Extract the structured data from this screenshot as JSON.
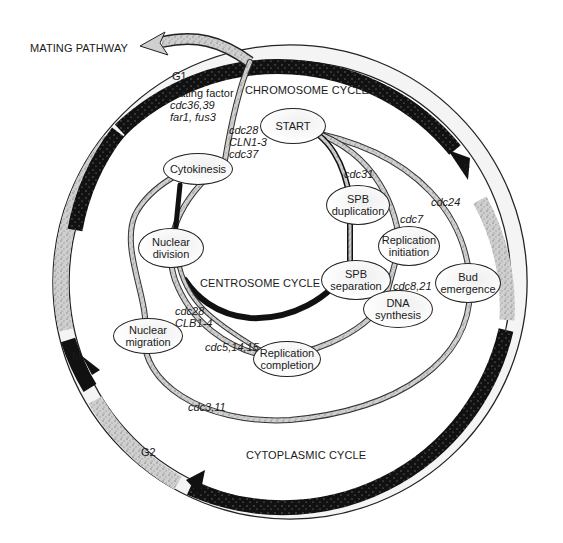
{
  "diagram": {
    "title_labels": {
      "mating_pathway": "MATING PATHWAY",
      "chromosome_cycle": "CHROMOSOME CYCLE",
      "centrosome_cycle": "CENTROSOME CYCLE",
      "cytoplasmic_cycle": "CYTOPLASMIC CYCLE"
    },
    "phases": {
      "g1": "G1",
      "s": "S",
      "g2": "G2",
      "m": "M"
    },
    "mating_block": {
      "line1": "mating  factor",
      "line2": "cdc36,39",
      "line3": "far1, fus3"
    },
    "start_genes": {
      "line1": "cdc28",
      "line2": "CLN1-3",
      "line3": "cdc37"
    },
    "nodes": {
      "start": [
        "START"
      ],
      "cytokinesis": [
        "Cytokinesis"
      ],
      "spb_duplication": [
        "SPB",
        "duplication"
      ],
      "replication_initiation": [
        "Replication",
        "initiation"
      ],
      "nuclear_division": [
        "Nuclear",
        "division"
      ],
      "spb_separation": [
        "SPB",
        "separation"
      ],
      "bud_emergence": [
        "Bud",
        "emergence"
      ],
      "dna_synthesis": [
        "DNA",
        "synthesis"
      ],
      "nuclear_migration": [
        "Nuclear",
        "migration"
      ],
      "replication_completion": [
        "Replication",
        "completion"
      ]
    },
    "gene_labels": {
      "cdc31": "cdc31",
      "cdc7": "cdc7",
      "cdc24": "cdc24",
      "cdc8_21": "cdc8,21",
      "cdc28_b": "cdc28",
      "clb1_4": "CLB1-4",
      "cdc5_14_15": "cdc5,14,15",
      "cdc3_11": "cdc3,11"
    },
    "colors": {
      "ring_dark": "#111111",
      "ring_light": "#d9d9d9",
      "pathway_gray": "#a8a8a8",
      "pathway_dark": "#2a2a2a",
      "text": "#1a1a1a"
    }
  }
}
